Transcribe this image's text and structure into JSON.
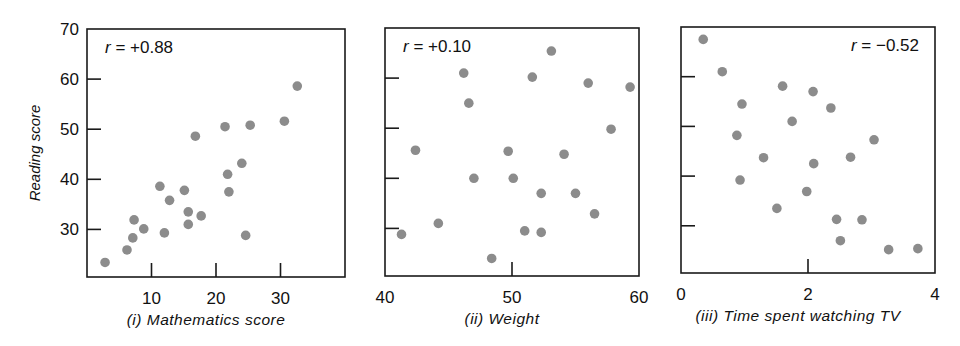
{
  "figure": {
    "ylabel": "Reading score",
    "dot_color": "#8c8c8c"
  },
  "chart_data": [
    {
      "type": "scatter",
      "title": "(i) Mathematics score",
      "xlabel": "(i) Mathematics score",
      "ylabel": "Reading score",
      "annotation": "r = +0.88",
      "xlim": [
        0,
        40
      ],
      "ylim": [
        20.5,
        70
      ],
      "xticks": [
        10,
        20,
        30
      ],
      "yticks": [
        30,
        40,
        50,
        60,
        70
      ],
      "grid": false,
      "points": [
        [
          2.8,
          23.4
        ],
        [
          6.2,
          25.9
        ],
        [
          7.1,
          28.3
        ],
        [
          7.3,
          31.9
        ],
        [
          8.8,
          30.1
        ],
        [
          11.3,
          38.6
        ],
        [
          12.0,
          29.3
        ],
        [
          12.8,
          35.8
        ],
        [
          15.1,
          37.8
        ],
        [
          15.7,
          33.5
        ],
        [
          15.7,
          31.0
        ],
        [
          16.8,
          48.6
        ],
        [
          17.7,
          32.7
        ],
        [
          21.4,
          50.5
        ],
        [
          21.8,
          41.0
        ],
        [
          22.0,
          37.5
        ],
        [
          24.0,
          43.2
        ],
        [
          24.6,
          28.8
        ],
        [
          25.3,
          50.8
        ],
        [
          30.6,
          51.6
        ],
        [
          32.6,
          58.6
        ]
      ]
    },
    {
      "type": "scatter",
      "title": "(ii) Weight",
      "xlabel": "(ii) Weight",
      "ylabel": "Reading score",
      "annotation": "r = +0.10",
      "xlim": [
        40,
        60
      ],
      "ylim": [
        20.5,
        70
      ],
      "xticks": [
        40,
        50,
        60
      ],
      "yticks": [
        30,
        40,
        50,
        60
      ],
      "grid": false,
      "points": [
        [
          41.3,
          28.8
        ],
        [
          42.4,
          45.6
        ],
        [
          44.2,
          31.0
        ],
        [
          46.2,
          61.0
        ],
        [
          46.6,
          55.0
        ],
        [
          47.0,
          40.0
        ],
        [
          48.4,
          24.0
        ],
        [
          49.7,
          45.4
        ],
        [
          50.1,
          40.0
        ],
        [
          51.0,
          29.5
        ],
        [
          51.6,
          60.2
        ],
        [
          52.3,
          37.0
        ],
        [
          52.3,
          29.2
        ],
        [
          53.1,
          65.4
        ],
        [
          54.1,
          44.8
        ],
        [
          55.0,
          37.0
        ],
        [
          56.0,
          59.0
        ],
        [
          56.5,
          32.9
        ],
        [
          57.8,
          49.8
        ],
        [
          59.3,
          58.2
        ]
      ]
    },
    {
      "type": "scatter",
      "title": "(iii) Time spent watching TV",
      "xlabel": "(iii) Time spent watching TV",
      "ylabel": "Reading score",
      "annotation": "r = −0.52",
      "xlim": [
        0,
        4
      ],
      "ylim": [
        20.5,
        70
      ],
      "xticks": [
        0,
        2,
        4
      ],
      "yticks": [
        30,
        40,
        50,
        60
      ],
      "grid": false,
      "points": [
        [
          0.35,
          67.5
        ],
        [
          0.65,
          61.0
        ],
        [
          0.96,
          54.5
        ],
        [
          0.88,
          48.2
        ],
        [
          0.93,
          39.2
        ],
        [
          1.3,
          43.7
        ],
        [
          1.51,
          33.5
        ],
        [
          1.6,
          58.1
        ],
        [
          1.75,
          51.0
        ],
        [
          1.98,
          36.9
        ],
        [
          2.08,
          57.0
        ],
        [
          2.09,
          42.5
        ],
        [
          2.36,
          53.7
        ],
        [
          2.45,
          31.3
        ],
        [
          2.51,
          27.0
        ],
        [
          2.67,
          43.8
        ],
        [
          2.85,
          31.2
        ],
        [
          3.04,
          47.3
        ],
        [
          3.27,
          25.2
        ],
        [
          3.73,
          25.4
        ]
      ]
    }
  ]
}
